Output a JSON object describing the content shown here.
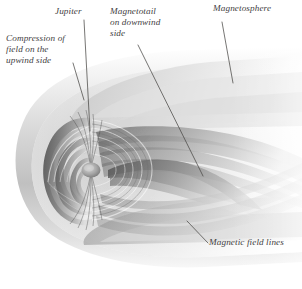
{
  "figure": {
    "background_color": "#ffffff",
    "label_color": "#43413f",
    "width": 302,
    "height": 289
  },
  "labels": {
    "compression": "Compression of\nfield on the\nupwind side",
    "jupiter": "Jupiter",
    "magnetotail": "Magnetotail\non downwind\nside",
    "magnetosphere": "Magnetosphere",
    "field_lines": "Magnetic field lines"
  },
  "leaders": {
    "compression": "M 73,63 L 84,100",
    "jupiter": "M 84,20 L 90,131",
    "magnetotail": "M 138,45 L 203,176",
    "magnetosphere": "M 222,22 L 233,83",
    "field_lines": "M 187,221 L 208,243"
  },
  "palette": {
    "shell_light": "#f2f2f2",
    "shell_mid": "#cfcfcf",
    "shell_dark": "#8e8e8e",
    "core_dark": "#5a5a5a",
    "core_mid": "#8c8c8c",
    "tail_light": "#e8e8e8",
    "leader_line": "#4a4846"
  }
}
